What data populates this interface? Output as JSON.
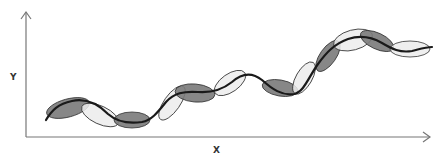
{
  "diagram": {
    "x_axis_label": "X",
    "y_axis_label": "Y",
    "colors": {
      "axis": "#777777",
      "curve": "#1a1a1a",
      "dark_fill": "#7a7a7a",
      "light_fill": "#ececec",
      "outline": "#333333"
    },
    "axes": {
      "origin": [
        26,
        137
      ],
      "y_top": 12,
      "x_right": 430
    },
    "ellipses": [
      {
        "cx": 68,
        "cy": 108,
        "rx": 22,
        "ry": 9,
        "rot": -15,
        "shade": "dark"
      },
      {
        "cx": 100,
        "cy": 115,
        "rx": 20,
        "ry": 9,
        "rot": 25,
        "shade": "light"
      },
      {
        "cx": 132,
        "cy": 120,
        "rx": 18,
        "ry": 8,
        "rot": 0,
        "shade": "dark"
      },
      {
        "cx": 172,
        "cy": 103,
        "rx": 20,
        "ry": 8,
        "rot": -55,
        "shade": "light"
      },
      {
        "cx": 195,
        "cy": 93,
        "rx": 20,
        "ry": 9,
        "rot": 5,
        "shade": "dark"
      },
      {
        "cx": 230,
        "cy": 83,
        "rx": 18,
        "ry": 9,
        "rot": -35,
        "shade": "light"
      },
      {
        "cx": 280,
        "cy": 88,
        "rx": 18,
        "ry": 8,
        "rot": 10,
        "shade": "dark"
      },
      {
        "cx": 304,
        "cy": 78,
        "rx": 18,
        "ry": 8,
        "rot": -60,
        "shade": "light"
      },
      {
        "cx": 328,
        "cy": 56,
        "rx": 18,
        "ry": 8,
        "rot": -55,
        "shade": "dark"
      },
      {
        "cx": 353,
        "cy": 40,
        "rx": 20,
        "ry": 10,
        "rot": -15,
        "shade": "light"
      },
      {
        "cx": 377,
        "cy": 41,
        "rx": 18,
        "ry": 8,
        "rot": 25,
        "shade": "dark"
      },
      {
        "cx": 410,
        "cy": 49,
        "rx": 20,
        "ry": 8,
        "rot": 0,
        "shade": "light"
      }
    ],
    "curve_path": "M46,120 C52,110 58,104 72,101 C86,98 98,104 108,114 C116,121 128,124 142,122 C152,120 158,112 166,102 C174,93 184,91 198,92 C212,93 222,90 232,82 C242,73 252,72 262,80 C272,89 282,96 294,94 C304,92 308,78 318,64 C326,53 334,44 348,39 C360,35 370,36 382,43 C392,49 400,53 412,51 C420,49 426,47 432,47"
  }
}
